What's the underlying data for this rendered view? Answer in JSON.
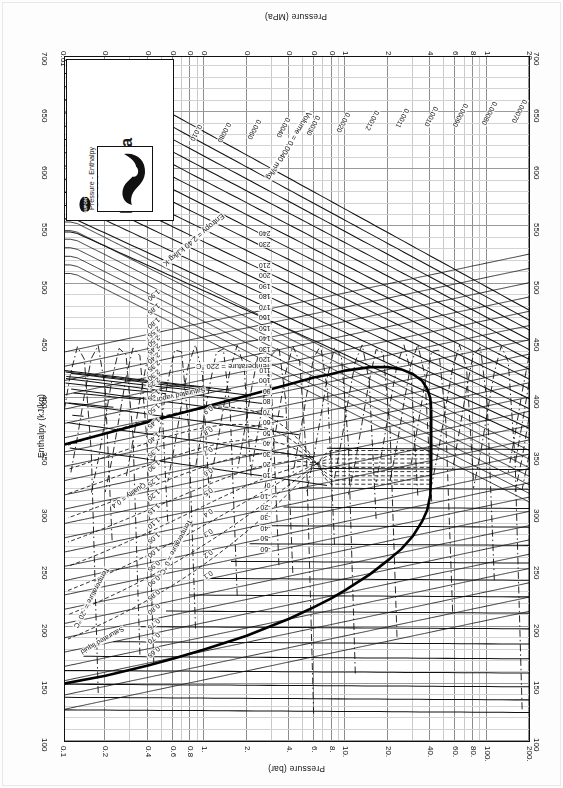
{
  "document": {
    "kind": "pressure-enthalpy-chart",
    "orientation_note": "sheet printed upside-down (rotated 180 degrees)"
  },
  "title_block": {
    "subtitle_line1": "Pressure - Enthalpy",
    "subtitle_line2": "Diagram",
    "refrigerant": "HFC-134a",
    "units": "(SI Units)",
    "company": "DUPONT",
    "brand": "SUVA",
    "brand_mark": "®"
  },
  "axes": {
    "top": {
      "label": "Pressure (bar)",
      "ticks": [
        "200.",
        "100.",
        "80.",
        "60.",
        "40.",
        "20.",
        "10.",
        "8.",
        "6.",
        "4.",
        "2.",
        "1.",
        "0.8",
        "0.6",
        "0.4",
        "0.2",
        "0.1"
      ]
    },
    "bottom": {
      "label": "Pressure (MPa)",
      "ticks": [
        "20.",
        "10.",
        "8.",
        "6.",
        "4.",
        "2.",
        "1.",
        "0.8",
        "0.6",
        "0.4",
        "0.2",
        "0.1",
        "0.08",
        "0.06",
        "0.04",
        "0.02",
        "0.01"
      ]
    },
    "right": {
      "label": "Enthalpy (kJ/kg)",
      "ticks": [
        "700",
        "650",
        "600",
        "550",
        "500",
        "450",
        "400",
        "350",
        "300",
        "250",
        "200",
        "150",
        "100"
      ]
    },
    "left": {
      "label": "",
      "ticks": [
        "700",
        "650",
        "600",
        "550",
        "500",
        "450",
        "400",
        "350",
        "300",
        "250",
        "200",
        "150",
        "100"
      ]
    }
  },
  "chart_data": {
    "type": "line",
    "xlabel": "Enthalpy (kJ/kg)",
    "ylabel": "Pressure (MPa)",
    "ylabel_secondary": "Pressure (bar)",
    "xlim": [
      100,
      700
    ],
    "ylim_mpa": [
      0.01,
      20.0
    ],
    "ylim_bar": [
      0.1,
      200.0
    ],
    "yscale": "log",
    "grid": true,
    "legend": "none",
    "critical_point": {
      "enthalpy_kJ_kg": 390,
      "pressure_MPa": 4.06,
      "temperature_C": 101.1
    },
    "series": [
      {
        "name": "saturated-liquid",
        "label": "Saturated liquid",
        "style": "thick-solid"
      },
      {
        "name": "saturated-vapor",
        "label": "Saturated vapor",
        "style": "thick-solid"
      },
      {
        "name": "isotherms",
        "label_template": "Temperature = 220 °C",
        "label_anchor_high": "Temperature = 220 °C",
        "label_anchor_mid": "Temperature = 0 °C",
        "label_anchor_low": "Temperature = -20 °C",
        "unit": "°C",
        "values": [
          240,
          230,
          220,
          210,
          200,
          190,
          180,
          170,
          160,
          150,
          140,
          130,
          120,
          110,
          100,
          90,
          80,
          70,
          60,
          50,
          40,
          30,
          20,
          10,
          0,
          -10,
          -20,
          -30,
          -40,
          -50,
          -60
        ]
      },
      {
        "name": "isochores",
        "label_anchor": "Volume = 0.0040 m³/kg",
        "unit": "m3/kg",
        "values": [
          "0.00070",
          "0.00080",
          "0.00090",
          "0.0010",
          "0.0011",
          "0.0012",
          "0.0020",
          "0.0030",
          "0.0040",
          "0.0060",
          "0.0080",
          "0.010",
          "0.015",
          "0.020",
          "0.030",
          "0.040",
          "0.060",
          "0.080",
          "0.10",
          "0.15",
          "0.20",
          "0.30",
          "0.40",
          "0.60",
          "0.80",
          "1.0",
          "1.5",
          "2.0"
        ]
      },
      {
        "name": "isentropes",
        "label_anchor": "Entropy = 2.40 kJ/kg·K",
        "unit": "kJ/kg·K",
        "values": [
          "0.65",
          "0.70",
          "0.75",
          "0.80",
          "0.85",
          "0.90",
          "0.95",
          "1.00",
          "1.05",
          "1.10",
          "1.15",
          "1.20",
          "1.25",
          "1.30",
          "1.35",
          "1.40",
          "1.45",
          "1.50",
          "1.55",
          "1.60",
          "1.65",
          "1.70",
          "1.75",
          "1.80",
          "1.85",
          "1.90",
          "2.25",
          "2.30",
          "2.35",
          "2.40",
          "2.45",
          "2.50",
          "2.55"
        ]
      },
      {
        "name": "quality-lines",
        "label_anchor": "Quality = 0.4",
        "values": [
          "0.1",
          "0.2",
          "0.3",
          "0.4",
          "0.5",
          "0.6",
          "0.7",
          "0.8",
          "0.9"
        ]
      }
    ]
  },
  "inplot_labels": {
    "volume_anchor": "Volume = 0.0040 m³/kg",
    "temperature_anchor_high": "Temperature = 220 °C",
    "temperature_anchor_zero": "Temperature = 0 °C",
    "temperature_anchor_low": "Temperature = -20 °C",
    "entropy_anchor": "Entropy = 2.40 kJ/kg·K",
    "quality_anchor": "Quality = 0.4",
    "sat_liquid": "Saturated liquid",
    "sat_vapor": "Saturated vapor"
  },
  "colors": {
    "ink": "#111111",
    "grid_minor": "#cccccc",
    "grid_major": "#909090",
    "paper": "#fdfdfd"
  }
}
